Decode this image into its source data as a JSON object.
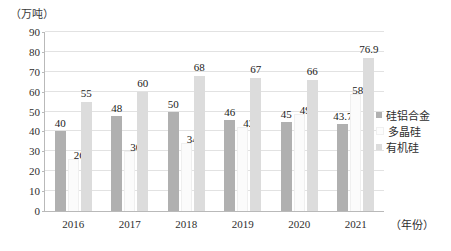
{
  "chart_data": {
    "type": "bar",
    "title": "",
    "subtitle": "",
    "unit_label": "（万吨）",
    "xlabel": "（年份）",
    "ylabel": "",
    "ylim": [
      0,
      90
    ],
    "ytick_step": 10,
    "yticks": [
      "90",
      "80",
      "70",
      "60",
      "50",
      "40",
      "30",
      "20",
      "10",
      "0"
    ],
    "grid": true,
    "legend_position": "right",
    "categories": [
      "2016",
      "2017",
      "2018",
      "2019",
      "2020",
      "2021"
    ],
    "series": [
      {
        "name": "硅铝合金",
        "color": "#b0b0b0",
        "values": [
          40,
          48,
          50,
          46,
          45,
          43.7
        ],
        "labels": [
          "40",
          "48",
          "50",
          "46",
          "45",
          "43.7"
        ]
      },
      {
        "name": "多晶硅",
        "color": "#fbfbfb",
        "values": [
          26,
          30,
          34,
          42,
          49,
          58.8
        ],
        "labels": [
          "26",
          "30",
          "34",
          "42",
          "49",
          "58.8"
        ]
      },
      {
        "name": "有机硅",
        "color": "#dcdcdc",
        "values": [
          55,
          60,
          68,
          67,
          66,
          76.9
        ],
        "labels": [
          "55",
          "60",
          "68",
          "67",
          "66",
          "76.9"
        ]
      }
    ]
  }
}
